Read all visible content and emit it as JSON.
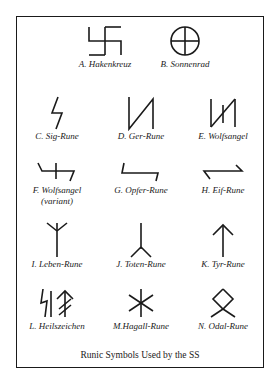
{
  "caption": "Runic Symbols Used by the SS",
  "symbols": [
    {
      "id": "A",
      "label": "A. Hakenkreuz"
    },
    {
      "id": "B",
      "label": "B. Sonnenrad"
    },
    {
      "id": "C",
      "label": "C. Sig-Rune"
    },
    {
      "id": "D",
      "label": "D. Ger-Rune"
    },
    {
      "id": "E",
      "label": "E. Wolfsangel"
    },
    {
      "id": "F",
      "label": "F. Wolfsangel",
      "sublabel": "(variant)"
    },
    {
      "id": "G",
      "label": "G. Opfer-Rune"
    },
    {
      "id": "H",
      "label": "H. Eif-Rune"
    },
    {
      "id": "I",
      "label": "I.  Leben-Rune"
    },
    {
      "id": "J",
      "label": "J.  Toten-Rune"
    },
    {
      "id": "K",
      "label": "K. Tyr-Rune"
    },
    {
      "id": "L",
      "label": "L. Heilszeichen"
    },
    {
      "id": "M",
      "label": "M.Hagall-Rune"
    },
    {
      "id": "N",
      "label": "N. Odal-Rune"
    }
  ]
}
